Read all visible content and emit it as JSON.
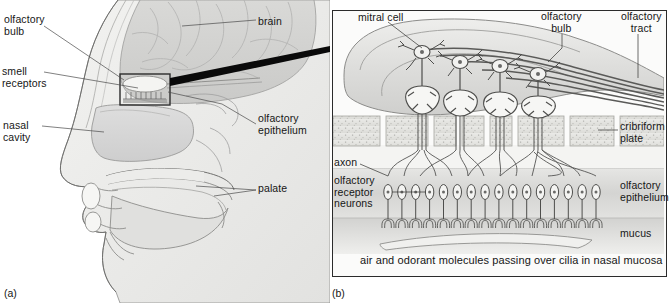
{
  "figure": {
    "panels": [
      {
        "tag": "(a)",
        "name": "sagittal-head-section"
      },
      {
        "tag": "(b)",
        "name": "olfactory-bulb-detail"
      }
    ]
  },
  "panel_a": {
    "tag": "(a)",
    "labels": [
      {
        "id": "olfactory-bulb",
        "text": "olfactory\nbulb",
        "x": 4,
        "y": 14
      },
      {
        "id": "smell-receptors",
        "text": "smell\nreceptors",
        "x": 2,
        "y": 66
      },
      {
        "id": "nasal-cavity",
        "text": "nasal\ncavity",
        "x": 3,
        "y": 120
      },
      {
        "id": "brain",
        "text": "brain",
        "x": 258,
        "y": 16
      },
      {
        "id": "olfactory-epithelium",
        "text": "olfactory\nepithelium",
        "x": 258,
        "y": 113
      },
      {
        "id": "palate",
        "text": "palate",
        "x": 258,
        "y": 183
      }
    ],
    "inset_box": {
      "x": 120,
      "y": 74,
      "w": 50,
      "h": 31
    }
  },
  "panel_b": {
    "tag": "(b)",
    "caption": "air and odorant molecules passing over cilia in nasal mucosa",
    "labels": [
      {
        "id": "mitral-cell",
        "text": "mitral cell",
        "x": 28,
        "y": 10
      },
      {
        "id": "olfactory-bulb",
        "text": "olfactory\nbulb",
        "x": 214,
        "y": 9
      },
      {
        "id": "olfactory-tract",
        "text": "olfactory\ntract",
        "x": 292,
        "y": 9
      },
      {
        "id": "cribriform-plate",
        "text": "cribriform\nplate",
        "x": 290,
        "y": 123
      },
      {
        "id": "axon",
        "text": "axon",
        "x": 4,
        "y": 157
      },
      {
        "id": "olfactory-receptor-neurons",
        "text": "olfactory\nreceptor\nneurons",
        "x": 4,
        "y": 175
      },
      {
        "id": "olfactory-epithelium",
        "text": "olfactory\nepithelium",
        "x": 290,
        "y": 182
      },
      {
        "id": "mucus",
        "text": "mucus",
        "x": 290,
        "y": 228
      }
    ],
    "layers": [
      {
        "id": "olfactory-bulb-body",
        "name": "olfactory bulb"
      },
      {
        "id": "cribriform-plate-layer",
        "name": "cribriform plate"
      },
      {
        "id": "lamina-propria",
        "name": "lamina propria"
      },
      {
        "id": "olfactory-epithelium-layer",
        "name": "olfactory epithelium"
      },
      {
        "id": "mucus-layer",
        "name": "mucus"
      }
    ],
    "counts": {
      "mitral_cells": 4,
      "glomeruli": 4,
      "receptor_neurons": 16,
      "tract_fibers": 6
    }
  },
  "colors": {
    "ink": "#2b2b2b",
    "label_text": "#161616",
    "bulb_fill": "#d8d8d6",
    "bulb_fill_light": "#ececeb",
    "bone_fill": "#e4e4e1",
    "epithelium_fill": "#dcdcda",
    "mucus_fill": "#cfcfcd",
    "panel_bg": "#fbfbfa",
    "head_fill": "#e9e9e7",
    "brain_fill": "#d5d5d3",
    "pointer_black": "#0a0a0a"
  }
}
